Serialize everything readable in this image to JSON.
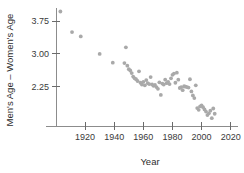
{
  "chart_data": {
    "type": "scatter",
    "title": "",
    "xlabel": "Year",
    "ylabel": "Men's Age – Women's Age",
    "xlim": [
      1900,
      2025
    ],
    "ylim": [
      1.35,
      4.05
    ],
    "grid": false,
    "legend": null,
    "xticks": [
      1920,
      1940,
      1960,
      1980,
      2000,
      2020
    ],
    "xtick_labels": [
      "1920",
      "1940",
      "1960",
      "1980",
      "2000",
      "2020"
    ],
    "yticks": [
      2.25,
      3.0,
      3.75
    ],
    "ytick_labels": [
      "2.25",
      "3.00",
      "3.75"
    ],
    "marker": {
      "shape": "circle",
      "color": "#a9a9a9",
      "radius": 1.9
    },
    "series": [
      {
        "name": "Men's Age minus Women's Age",
        "x": [
          1903,
          1911,
          1917,
          1930,
          1939,
          1947,
          1948,
          1949,
          1950,
          1951,
          1952,
          1953,
          1954,
          1955,
          1956,
          1957,
          1958,
          1959,
          1960,
          1961,
          1962,
          1963,
          1964,
          1965,
          1966,
          1967,
          1968,
          1969,
          1970,
          1971,
          1972,
          1973,
          1974,
          1975,
          1976,
          1977,
          1978,
          1979,
          1980,
          1981,
          1982,
          1983,
          1984,
          1985,
          1986,
          1987,
          1988,
          1989,
          1990,
          1991,
          1992,
          1993,
          1994,
          1995,
          1996,
          1997,
          1998,
          1999,
          2000,
          2001,
          2002,
          2003,
          2004,
          2005,
          2006,
          2007,
          2008,
          2009
        ],
        "y": [
          3.97,
          3.5,
          3.4,
          3.0,
          2.8,
          2.79,
          3.15,
          2.73,
          2.65,
          2.62,
          2.56,
          2.48,
          2.44,
          2.42,
          2.38,
          2.6,
          2.34,
          2.3,
          2.36,
          2.28,
          2.4,
          2.33,
          2.31,
          2.47,
          2.3,
          2.27,
          2.29,
          2.24,
          2.2,
          2.35,
          2.06,
          2.32,
          2.3,
          2.41,
          2.33,
          2.36,
          2.31,
          2.44,
          2.52,
          2.55,
          2.34,
          2.57,
          2.41,
          2.22,
          2.24,
          2.17,
          2.26,
          2.25,
          2.24,
          2.23,
          2.42,
          2.14,
          2.05,
          1.99,
          2.28,
          1.76,
          1.72,
          1.8,
          1.82,
          1.78,
          1.73,
          1.68,
          1.6,
          1.64,
          1.7,
          1.53,
          1.75,
          1.63
        ]
      }
    ]
  }
}
